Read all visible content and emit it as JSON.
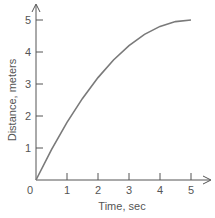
{
  "chart_data": {
    "type": "line",
    "title": "",
    "xlabel": "Time, sec",
    "ylabel": "Distance, meters",
    "x_ticks": [
      "0",
      "1",
      "2",
      "3",
      "4",
      "5"
    ],
    "y_ticks": [
      "1",
      "2",
      "3",
      "4",
      "5"
    ],
    "xlim": [
      0,
      5.4
    ],
    "ylim": [
      0,
      5.5
    ],
    "grid": false,
    "legend": null,
    "series": [
      {
        "name": "distance",
        "x": [
          0,
          0.5,
          1,
          1.5,
          2,
          2.5,
          3,
          3.5,
          4,
          4.5,
          5
        ],
        "values": [
          0,
          0.95,
          1.8,
          2.55,
          3.2,
          3.75,
          4.2,
          4.55,
          4.8,
          4.95,
          5.0
        ]
      }
    ],
    "colors": {
      "axis": "#555555",
      "line": "#7a7a7a"
    }
  }
}
